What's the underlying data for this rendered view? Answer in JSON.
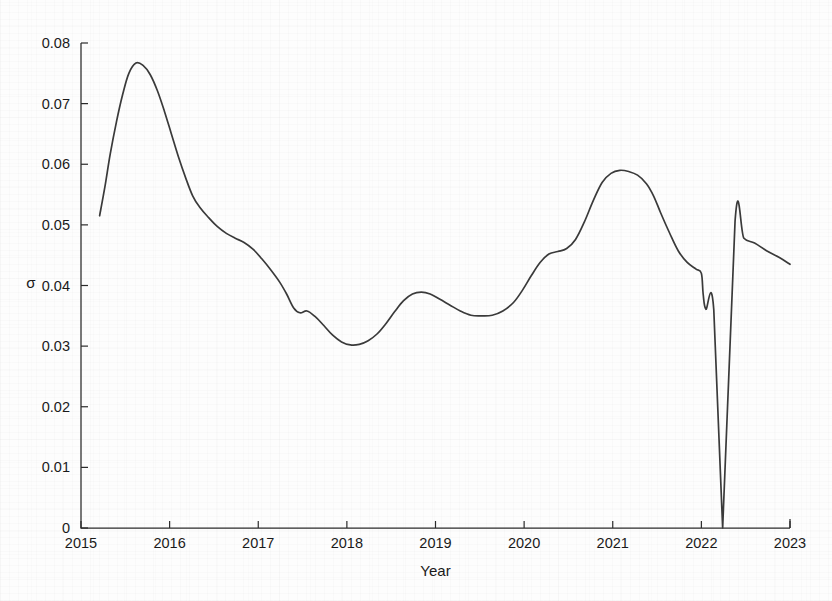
{
  "figure": {
    "width": 832,
    "height": 601,
    "background_color": "#fdfdfd",
    "line_color": "#3a3a3a",
    "axis_color": "#2b2b2b"
  },
  "chart_data": {
    "type": "line",
    "title": "",
    "xlabel": "Year",
    "ylabel": "σ",
    "xlim": [
      2015,
      2023
    ],
    "ylim": [
      0,
      0.08
    ],
    "grid": false,
    "legend": null,
    "xticks": [
      2015,
      2016,
      2017,
      2018,
      2019,
      2020,
      2021,
      2022,
      2023
    ],
    "xtick_labels": [
      "2015",
      "2016",
      "2017",
      "2018",
      "2019",
      "2020",
      "2021",
      "2022",
      "2023"
    ],
    "yticks": [
      0,
      0.01,
      0.02,
      0.03,
      0.04,
      0.05,
      0.06,
      0.07,
      0.08
    ],
    "ytick_labels": [
      "0",
      "0.01",
      "0.02",
      "0.03",
      "0.04",
      "0.05",
      "0.06",
      "0.07",
      "0.08"
    ],
    "series": [
      {
        "name": "sigma",
        "color": "#3a3a3a",
        "x": [
          2015.21,
          2015.27,
          2015.33,
          2015.4,
          2015.47,
          2015.54,
          2015.62,
          2015.7,
          2015.78,
          2015.86,
          2015.94,
          2016.02,
          2016.1,
          2016.18,
          2016.26,
          2016.34,
          2016.44,
          2016.54,
          2016.64,
          2016.74,
          2016.84,
          2016.94,
          2017.04,
          2017.14,
          2017.24,
          2017.32,
          2017.4,
          2017.47,
          2017.55,
          2017.64,
          2017.74,
          2017.84,
          2017.94,
          2018.04,
          2018.14,
          2018.24,
          2018.34,
          2018.44,
          2018.54,
          2018.64,
          2018.74,
          2018.84,
          2018.94,
          2019.04,
          2019.16,
          2019.28,
          2019.4,
          2019.52,
          2019.64,
          2019.76,
          2019.88,
          2019.98,
          2020.08,
          2020.18,
          2020.28,
          2020.38,
          2020.48,
          2020.58,
          2020.68,
          2020.78,
          2020.88,
          2020.98,
          2021.08,
          2021.18,
          2021.28,
          2021.38,
          2021.46,
          2021.54,
          2021.64,
          2021.74,
          2021.84,
          2021.94,
          2022.0,
          2022.02,
          2022.05,
          2022.14,
          2022.24,
          2022.38,
          2022.48,
          2022.6,
          2022.74,
          2022.88,
          2023.0
        ],
        "y": [
          0.0515,
          0.0563,
          0.0617,
          0.067,
          0.0715,
          0.075,
          0.0767,
          0.0763,
          0.0748,
          0.0722,
          0.0688,
          0.065,
          0.0612,
          0.0578,
          0.0548,
          0.0529,
          0.0512,
          0.0497,
          0.0486,
          0.0478,
          0.0471,
          0.046,
          0.0444,
          0.0426,
          0.0406,
          0.0386,
          0.0363,
          0.0355,
          0.0358,
          0.0349,
          0.0334,
          0.0318,
          0.0307,
          0.0302,
          0.0303,
          0.0309,
          0.032,
          0.0337,
          0.0357,
          0.0375,
          0.0386,
          0.0389,
          0.0386,
          0.0378,
          0.0368,
          0.0358,
          0.0351,
          0.035,
          0.0351,
          0.0358,
          0.0372,
          0.0392,
          0.0416,
          0.0438,
          0.0452,
          0.0456,
          0.0461,
          0.0476,
          0.0505,
          0.054,
          0.057,
          0.0585,
          0.059,
          0.0588,
          0.0582,
          0.0568,
          0.0548,
          0.052,
          0.0487,
          0.0457,
          0.0438,
          0.0427,
          0.042,
          0.0386,
          0.0361,
          0.036,
          0.0,
          0.0506,
          0.0478,
          0.047,
          0.0457,
          0.0446,
          0.0435
        ]
      }
    ],
    "annotations": [
      {
        "text": "sharp drop to zero near 2022.2 followed by immediate rebound to ~0.051",
        "x": 2022.24,
        "y": 0.0
      }
    ]
  },
  "plot_geometry": {
    "left_px": 81,
    "right_px": 790,
    "top_px": 43,
    "bottom_px": 528
  }
}
